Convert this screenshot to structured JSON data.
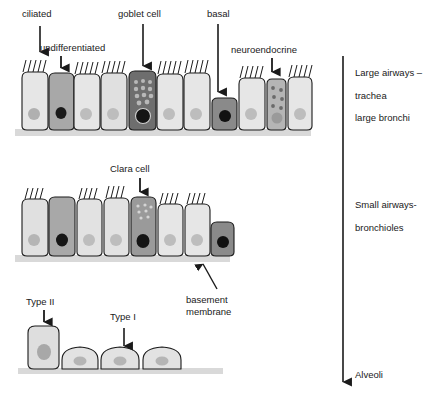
{
  "figure": {
    "background_color": "#ffffff",
    "outline_color": "#1a1a1a",
    "basement_membrane_color": "#d9d9d9"
  },
  "labels": {
    "ciliated": "ciliated",
    "undifferentiated": "undifferentiated",
    "goblet_cell": "goblet cell",
    "basal": "basal",
    "neuroendocrine": "neuroendocrine",
    "clara_cell": "Clara cell",
    "basement_membrane_line1": "basement",
    "basement_membrane_line2": "membrane",
    "type_two": "Type II",
    "type_one": "Type I"
  },
  "region_axis": {
    "arrow_direction": "down",
    "entries": [
      {
        "line1": "Large airways –",
        "line2": "trachea",
        "line3": "large bronchi"
      },
      {
        "line1": "Small airways-",
        "line2": "bronchioles"
      },
      {
        "line1": "Alveoli"
      }
    ],
    "large_airways_line1": "Large airways –",
    "large_airways_line2": "trachea",
    "large_airways_line3": "large bronchi",
    "small_airways_line1": "Small airways-",
    "small_airways_line2": "bronchioles",
    "alveoli": "Alveoli"
  },
  "rows": {
    "row1": {
      "name": "pseudostratified columnar epithelium",
      "cells": [
        {
          "type": "ciliated",
          "fill": "#e6e6e6",
          "nucleus": "#b0b0b0",
          "cilia": true
        },
        {
          "type": "undifferentiated",
          "fill": "#a8a8a8",
          "nucleus": "#1a1a1a",
          "cilia": false
        },
        {
          "type": "ciliated",
          "fill": "#e6e6e6",
          "nucleus": "#bdbdbd",
          "cilia": true
        },
        {
          "type": "ciliated",
          "fill": "#e0e0e0",
          "nucleus": "#bdbdbd",
          "cilia": true
        },
        {
          "type": "goblet",
          "fill": "#6e6e6e",
          "nucleus": "#1a1a1a",
          "cilia": false
        },
        {
          "type": "ciliated",
          "fill": "#e6e6e6",
          "nucleus": "#bdbdbd",
          "cilia": true
        },
        {
          "type": "ciliated",
          "fill": "#e6e6e6",
          "nucleus": "#bdbdbd",
          "cilia": true
        },
        {
          "type": "basal",
          "fill": "#8a8a8a",
          "nucleus": "#111111",
          "cilia": false
        },
        {
          "type": "ciliated",
          "fill": "#e6e6e6",
          "nucleus": "#bdbdbd",
          "cilia": true
        },
        {
          "type": "neuroendocrine",
          "fill": "#b5b5b5",
          "nucleus": "#9a9a9a",
          "cilia": false
        },
        {
          "type": "ciliated",
          "fill": "#e6e6e6",
          "nucleus": "#bdbdbd",
          "cilia": true
        }
      ]
    },
    "row2": {
      "name": "small airway epithelium",
      "cells": [
        {
          "type": "ciliated",
          "fill": "#e0e0e0",
          "nucleus": "#b5b5b5",
          "cilia": true
        },
        {
          "type": "undifferentiated",
          "fill": "#a8a8a8",
          "nucleus": "#161616",
          "cilia": false
        },
        {
          "type": "ciliated",
          "fill": "#e2e2e2",
          "nucleus": "#bdbdbd",
          "cilia": true
        },
        {
          "type": "ciliated",
          "fill": "#e2e2e2",
          "nucleus": "#bdbdbd",
          "cilia": true
        },
        {
          "type": "clara",
          "fill": "#9a9a9a",
          "nucleus": "#141414",
          "cilia": false
        },
        {
          "type": "ciliated",
          "fill": "#e6e6e6",
          "nucleus": "#bdbdbd",
          "cilia": true
        },
        {
          "type": "ciliated",
          "fill": "#e6e6e6",
          "nucleus": "#bdbdbd",
          "cilia": true
        },
        {
          "type": "basal",
          "fill": "#8a8a8a",
          "nucleus": "#111111",
          "cilia": false
        }
      ]
    },
    "row3": {
      "name": "alveolar epithelium",
      "cells": [
        {
          "type": "type-II",
          "fill": "#dedede",
          "nucleus": "#a8a8a8"
        },
        {
          "type": "type-I",
          "fill": "#e2e2e2",
          "nucleus": "#b5b5b5"
        },
        {
          "type": "type-I",
          "fill": "#e2e2e2",
          "nucleus": "#b5b5b5"
        },
        {
          "type": "type-I",
          "fill": "#e2e2e2",
          "nucleus": "#b5b5b5"
        }
      ]
    }
  }
}
